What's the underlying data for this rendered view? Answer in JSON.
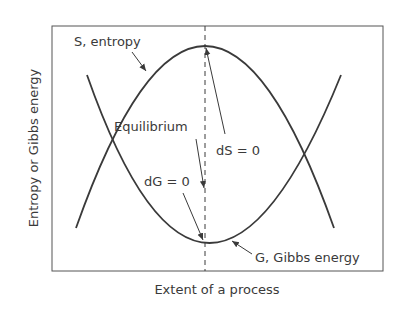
{
  "diagram": {
    "y_axis_label": "Entropy or Gibbs energy",
    "x_axis_label": "Extent of a process",
    "labels": {
      "entropy_curve": "S, entropy",
      "gibbs_curve": "G, Gibbs energy",
      "equilibrium": "Equilibrium",
      "dS": "dS = 0",
      "dG": "dG = 0"
    },
    "colors": {
      "line": "#3a3a3a",
      "background": "#ffffff"
    }
  }
}
